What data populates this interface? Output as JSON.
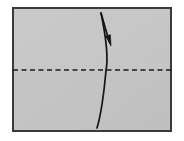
{
  "figure": {
    "kind": "origami-instruction-diagram",
    "background_color": "#ffffff",
    "width": 184,
    "height": 141
  },
  "paper_sheet": {
    "name": "paper-sheet",
    "shape": "rectangle",
    "fill_color": "#c6c6c6",
    "fill_color_secondary": "#c2c2c2",
    "border_color": "#3a3a3a",
    "border_width": 2,
    "x": 12,
    "y": 7,
    "width": 160,
    "height": 125
  },
  "crease_line": {
    "name": "horizontal-crease-line",
    "type": "valley-fold-crease",
    "style": "dashed",
    "color": "#1c1c1c",
    "stroke_width": 1.6,
    "dash_length": 5,
    "gap_length": 3.5,
    "x1": 13,
    "y1": 70,
    "x2": 171,
    "y2": 70
  },
  "fold_path": {
    "name": "curved-fold-line",
    "type": "curved-fold-edge",
    "color": "#141414",
    "stroke_width": 1.7,
    "start_x": 101,
    "start_y": 13,
    "end_x": 97,
    "end_y": 128,
    "bow_direction": "right",
    "crossing_x_at_crease": 106
  },
  "fold_arrow": {
    "name": "fold-direction-arrow",
    "type": "arrow",
    "direction": "down-right",
    "color": "#141414",
    "stroke_width": 1.7,
    "tail_x": 101,
    "tail_y": 13,
    "tip_x": 110,
    "tip_y": 45,
    "head_style": "filled-narrow-triangle",
    "head_length": 11,
    "head_width": 5
  },
  "labels": {
    "caption": "",
    "step_number": ""
  }
}
